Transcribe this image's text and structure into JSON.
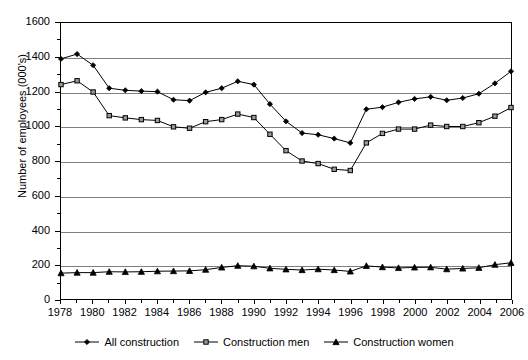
{
  "chart_data": {
    "type": "line",
    "title": "",
    "xlabel": "",
    "ylabel": "Number of employees (000's)",
    "ylim": [
      0,
      1600
    ],
    "ytick_step": 200,
    "yticks": [
      0,
      200,
      400,
      600,
      800,
      1000,
      1200,
      1400,
      1600
    ],
    "grid": true,
    "legend_position": "bottom",
    "x": [
      1978,
      1979,
      1980,
      1981,
      1982,
      1983,
      1984,
      1985,
      1986,
      1987,
      1988,
      1989,
      1990,
      1991,
      1992,
      1993,
      1994,
      1995,
      1996,
      1997,
      1998,
      1999,
      2000,
      2001,
      2002,
      2003,
      2004,
      2005,
      2006
    ],
    "xtick_labels": [
      1978,
      1980,
      1982,
      1984,
      1986,
      1988,
      1990,
      1992,
      1994,
      1996,
      1998,
      2000,
      2002,
      2004,
      2006
    ],
    "series": [
      {
        "name": "All construction",
        "marker": "diamond",
        "color": "#000000",
        "values": [
          1392,
          1420,
          1355,
          1222,
          1210,
          1205,
          1202,
          1155,
          1150,
          1198,
          1222,
          1262,
          1243,
          1130,
          1030,
          962,
          952,
          930,
          905,
          1100,
          1112,
          1140,
          1160,
          1172,
          1152,
          1165,
          1190,
          1250,
          1320
        ]
      },
      {
        "name": "Construction men",
        "marker": "square",
        "color": "#000000",
        "values": [
          1243,
          1265,
          1200,
          1063,
          1050,
          1040,
          1035,
          998,
          990,
          1028,
          1040,
          1072,
          1052,
          955,
          860,
          800,
          785,
          752,
          745,
          905,
          960,
          985,
          985,
          1008,
          1000,
          1000,
          1022,
          1060,
          1110
        ]
      },
      {
        "name": "Construction women",
        "marker": "triangle",
        "color": "#000000",
        "values": [
          150,
          153,
          153,
          158,
          157,
          158,
          161,
          162,
          163,
          170,
          183,
          193,
          190,
          178,
          172,
          168,
          173,
          168,
          160,
          192,
          185,
          180,
          183,
          184,
          173,
          177,
          181,
          199,
          210
        ]
      }
    ]
  },
  "legend": {
    "items": [
      {
        "label": "All construction",
        "marker": "diamond"
      },
      {
        "label": "Construction men",
        "marker": "square"
      },
      {
        "label": "Construction women",
        "marker": "triangle"
      }
    ]
  },
  "axis": {
    "y_title": "Number of employees (000's)"
  }
}
